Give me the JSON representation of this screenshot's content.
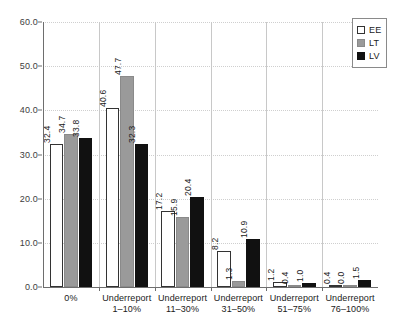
{
  "chart_data": {
    "type": "bar",
    "title": "",
    "subtitle": "",
    "xlabel": "",
    "ylabel": "",
    "ylim": [
      0.0,
      60.0
    ],
    "yticks": [
      "0.0",
      "10.0",
      "20.0",
      "30.0",
      "40.0",
      "50.0",
      "60.0"
    ],
    "ytick_values": [
      0.0,
      10.0,
      20.0,
      30.0,
      40.0,
      50.0,
      60.0
    ],
    "grid": true,
    "grid_axis": "y",
    "legend_position": "top-right",
    "categories": [
      "0%",
      "Underreport 1–10%",
      "Underreport 11–30%",
      "Underreport 31–50%",
      "Underreport 51–75%",
      "Underreport 76–100%"
    ],
    "category_lines": [
      [
        "0%",
        ""
      ],
      [
        "Underreport",
        "1–10%"
      ],
      [
        "Underreport",
        "11–30%"
      ],
      [
        "Underreport",
        "31–50%"
      ],
      [
        "Underreport",
        "51–75%"
      ],
      [
        "Underreport",
        "76–100%"
      ]
    ],
    "series": [
      {
        "name": "EE",
        "color": "#ffffff",
        "values": [
          32.4,
          40.6,
          17.2,
          8.2,
          1.2,
          0.4
        ],
        "labels": [
          "32.4",
          "40.6",
          "17.2",
          "8.2",
          "1.2",
          "0.4"
        ]
      },
      {
        "name": "LT",
        "color": "#9a9a9a",
        "values": [
          34.7,
          47.7,
          15.9,
          1.3,
          0.4,
          0.0
        ],
        "labels": [
          "34.7",
          "47.7",
          "15.9",
          "1.3",
          "0.4",
          "0.0"
        ]
      },
      {
        "name": "LV",
        "color": "#111111",
        "values": [
          33.8,
          32.3,
          20.4,
          10.9,
          1.0,
          1.5
        ],
        "labels": [
          "33.8",
          "32.3",
          "20.4",
          "10.9",
          "1.0",
          "1.5"
        ]
      }
    ]
  },
  "legend": {
    "items": [
      {
        "label": "EE",
        "swatch": "ee"
      },
      {
        "label": "LT",
        "swatch": "lt"
      },
      {
        "label": "LV",
        "swatch": "lv"
      }
    ]
  }
}
